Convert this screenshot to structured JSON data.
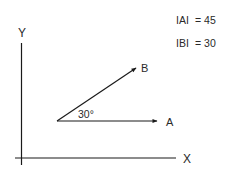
{
  "diagram": {
    "type": "vector-diagram",
    "axes": {
      "x_label": "X",
      "y_label": "Y"
    },
    "vectors": [
      {
        "name": "A",
        "label": "A",
        "angle_deg": 0
      },
      {
        "name": "B",
        "label": "B",
        "angle_deg": 30
      }
    ],
    "angle_label": "30°",
    "magnitudes": [
      {
        "label": "IAI",
        "eq": "= 45"
      },
      {
        "label": "IBI",
        "eq": "= 30"
      }
    ]
  },
  "colors": {
    "line": "#1a1a1a",
    "text": "#2a2a2a",
    "background": "#ffffff"
  }
}
